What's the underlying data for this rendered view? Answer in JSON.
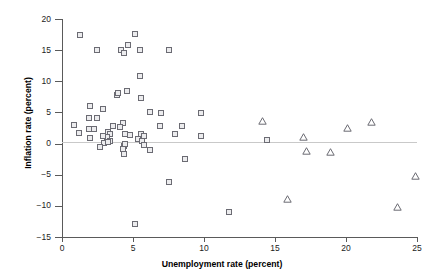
{
  "chart_data": {
    "type": "scatter",
    "title": "",
    "xlabel": "Unemployment rate (percent)",
    "ylabel": "Inflation rate (percent)",
    "xlim": [
      0,
      25
    ],
    "ylim": [
      -15,
      20
    ],
    "xticks": [
      0,
      5,
      10,
      15,
      20,
      25
    ],
    "yticks": [
      -15,
      -10,
      -5,
      0,
      5,
      10,
      15,
      20
    ],
    "xtick_labels": [
      "0",
      "5",
      "10",
      "15",
      "20",
      "25"
    ],
    "ytick_labels": [
      "-15",
      "-10",
      "-5",
      "0",
      "5",
      "10",
      "15",
      "20"
    ],
    "grid": false,
    "legend": "none",
    "reference_line": {
      "axis": "y",
      "value": 0,
      "color": "#c9c9c9"
    },
    "marker_colors": {
      "square_fill": "#ececee",
      "square_edge": "#6b6b73",
      "triangle_edge": "#6b6b73"
    },
    "series": [
      {
        "name": "square-series",
        "marker": "square",
        "points": [
          [
            1.3,
            17.3
          ],
          [
            2.5,
            15.0
          ],
          [
            4.2,
            15.0
          ],
          [
            4.4,
            14.5
          ],
          [
            4.7,
            15.7
          ],
          [
            5.2,
            17.5
          ],
          [
            5.5,
            14.9
          ],
          [
            7.6,
            14.9
          ],
          [
            5.5,
            10.7
          ],
          [
            3.9,
            7.7
          ],
          [
            4.0,
            8.0
          ],
          [
            4.6,
            8.3
          ],
          [
            5.6,
            7.2
          ],
          [
            2.0,
            6.0
          ],
          [
            2.9,
            5.4
          ],
          [
            6.2,
            5.0
          ],
          [
            7.0,
            4.8
          ],
          [
            9.8,
            4.8
          ],
          [
            1.9,
            4.1
          ],
          [
            2.5,
            4.0
          ],
          [
            4.3,
            3.3
          ],
          [
            3.6,
            2.7
          ],
          [
            4.1,
            2.6
          ],
          [
            0.9,
            2.9
          ],
          [
            1.9,
            2.2
          ],
          [
            2.3,
            2.3
          ],
          [
            3.3,
            1.8
          ],
          [
            3.4,
            1.5
          ],
          [
            4.5,
            1.4
          ],
          [
            4.8,
            1.3
          ],
          [
            5.6,
            1.5
          ],
          [
            5.8,
            1.2
          ],
          [
            6.9,
            2.7
          ],
          [
            8.5,
            2.7
          ],
          [
            1.2,
            1.6
          ],
          [
            2.0,
            0.9
          ],
          [
            3.2,
            1.0
          ],
          [
            8.0,
            1.4
          ],
          [
            9.8,
            1.1
          ],
          [
            2.9,
            1.2
          ],
          [
            3.4,
            0.3
          ],
          [
            5.4,
            0.6
          ],
          [
            5.7,
            0.3
          ],
          [
            3.0,
            0.0
          ],
          [
            3.3,
            0.1
          ],
          [
            2.7,
            -0.7
          ],
          [
            4.4,
            -0.4
          ],
          [
            4.5,
            -0.1
          ],
          [
            4.3,
            -1.0
          ],
          [
            5.8,
            -0.3
          ],
          [
            6.2,
            -1.1
          ],
          [
            4.4,
            -1.8
          ],
          [
            8.7,
            -2.6
          ],
          [
            14.5,
            0.5
          ],
          [
            7.6,
            -6.3
          ],
          [
            11.8,
            -11.0
          ],
          [
            5.2,
            -13.0
          ]
        ]
      },
      {
        "name": "triangle-series",
        "marker": "triangle",
        "points": [
          [
            14.1,
            3.6
          ],
          [
            17.0,
            1.0
          ],
          [
            17.2,
            -1.3
          ],
          [
            18.9,
            -1.5
          ],
          [
            20.1,
            2.4
          ],
          [
            21.8,
            3.4
          ],
          [
            15.9,
            -8.9
          ],
          [
            23.6,
            -10.2
          ],
          [
            24.9,
            -5.2
          ]
        ]
      }
    ]
  }
}
